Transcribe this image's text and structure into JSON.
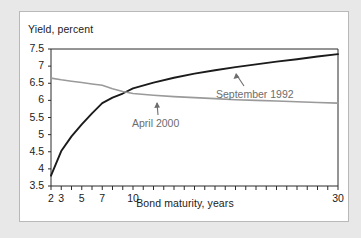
{
  "figure": {
    "background_color": "#e8e8e8",
    "card_color": "#ffffff",
    "border_color": "#b9b9b9"
  },
  "chart_data": {
    "type": "line",
    "title": "",
    "xlabel": "Bond maturity, years",
    "ylabel": "Yield, percent",
    "xlim": [
      2,
      30
    ],
    "ylim": [
      3.5,
      7.5
    ],
    "grid": false,
    "legend_position": "inline-annotations",
    "x_ticks_major": [
      2,
      3,
      5,
      7,
      10,
      30
    ],
    "x_tick_labels": [
      "2",
      "3",
      "5",
      "7",
      "10",
      "30"
    ],
    "x_ticks_minor": [
      2,
      3,
      4,
      5,
      6,
      7,
      8,
      9,
      10,
      11,
      12,
      13,
      14,
      15,
      16,
      17,
      18,
      19,
      20,
      21,
      22,
      23,
      24,
      25,
      26,
      27,
      28,
      29,
      30
    ],
    "y_ticks": [
      3.5,
      4,
      4.5,
      5,
      5.5,
      6,
      6.5,
      7,
      7.5
    ],
    "y_tick_labels": [
      "3.5",
      "4",
      "4.5",
      "5",
      "5.5",
      "6",
      "6.5",
      "7",
      "7.5"
    ],
    "series": [
      {
        "name": "April 2000",
        "color": "#1b1b1b",
        "line_width": 1.9,
        "annotation": "April 2000",
        "x": [
          2,
          3,
          4,
          5,
          6,
          7,
          8,
          9,
          10,
          12,
          14,
          16,
          18,
          20,
          22,
          24,
          26,
          28,
          30
        ],
        "values": [
          3.8,
          4.52,
          4.95,
          5.3,
          5.62,
          5.92,
          6.08,
          6.2,
          6.35,
          6.52,
          6.66,
          6.78,
          6.88,
          6.97,
          7.05,
          7.13,
          7.2,
          7.28,
          7.35
        ]
      },
      {
        "name": "September 1992",
        "color": "#9a9a9a",
        "line_width": 1.6,
        "annotation": "September 1992",
        "x": [
          2,
          3,
          4,
          5,
          6,
          7,
          8,
          9,
          10,
          12,
          14,
          16,
          18,
          20,
          22,
          24,
          26,
          28,
          30
        ],
        "values": [
          6.65,
          6.6,
          6.56,
          6.52,
          6.48,
          6.44,
          6.34,
          6.26,
          6.2,
          6.15,
          6.11,
          6.08,
          6.05,
          6.02,
          6.0,
          5.98,
          5.96,
          5.94,
          5.92
        ]
      }
    ],
    "annotations": [
      {
        "text": "September 1992",
        "points_to_series": "April 2000",
        "arrow": "up-left"
      },
      {
        "text": "April 2000",
        "points_to_series": "September 1992",
        "arrow": "up"
      }
    ]
  }
}
